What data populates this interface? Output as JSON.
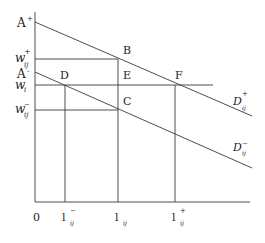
{
  "diagram": {
    "type": "supply-demand-wage-diagram",
    "axes": {
      "origin_label": "0",
      "x_axis": {
        "from": [
          35,
          202
        ],
        "to": [
          250,
          202
        ]
      },
      "y_axis": {
        "from": [
          35,
          12
        ],
        "to": [
          35,
          202
        ]
      }
    },
    "y_labels": {
      "a_plus": {
        "main": "A",
        "sup": "+"
      },
      "w_ij_plus": {
        "main": "w",
        "sup": "+",
        "sub": "ij"
      },
      "a_minus": {
        "main": "A",
        "sup": "-"
      },
      "w_i": {
        "main": "w",
        "sub": "i"
      },
      "w_ij_minus": {
        "main": "w",
        "sup": "−",
        "sub": "ij"
      }
    },
    "x_labels": {
      "l_ij_minus": {
        "main": "l",
        "sup": "−",
        "sub": "ij"
      },
      "l_ij": {
        "main": "l",
        "sub": "ij"
      },
      "l_ij_plus": {
        "main": "l",
        "sup": "+",
        "sub": "ij"
      }
    },
    "points": {
      "B": "B",
      "C": "C",
      "D": "D",
      "E": "E",
      "F": "F"
    },
    "curves": {
      "d_plus": {
        "main": "D",
        "sup": "+",
        "sub": "ij",
        "from": [
          35,
          22
        ],
        "to": [
          252,
          116
        ]
      },
      "d_minus": {
        "main": "D",
        "sup": "−",
        "sub": "ij",
        "from": [
          35,
          72
        ],
        "to": [
          252,
          168
        ]
      }
    },
    "colors": {
      "line": "#3a3a3a",
      "text": "#222222",
      "background": "#ffffff"
    }
  }
}
